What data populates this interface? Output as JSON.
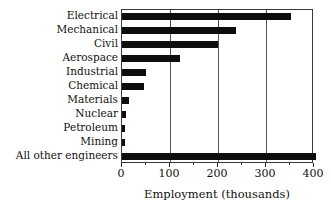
{
  "chart_data": {
    "type": "bar",
    "orientation": "horizontal",
    "title": "",
    "xlabel": "Employment (thousands)",
    "ylabel": "",
    "xlim": [
      0,
      400
    ],
    "xticks": [
      0,
      100,
      200,
      300,
      400
    ],
    "xtick_labels": [
      "0",
      "100",
      "200",
      "300",
      "400"
    ],
    "minor_xticks": [
      50,
      150,
      250,
      350
    ],
    "grid": "vertical gridlines at 100, 200, 300",
    "legend": "none",
    "bar_color": "#0d0d0d",
    "categories": [
      "Electrical",
      "Mechanical",
      "Civil",
      "Aerospace",
      "Industrial",
      "Chemical",
      "Materials",
      "Nuclear",
      "Petroleum",
      "Mining",
      "All other engineers"
    ],
    "values": [
      352,
      237,
      200,
      121,
      50,
      46,
      14,
      8,
      6,
      6,
      405
    ]
  }
}
